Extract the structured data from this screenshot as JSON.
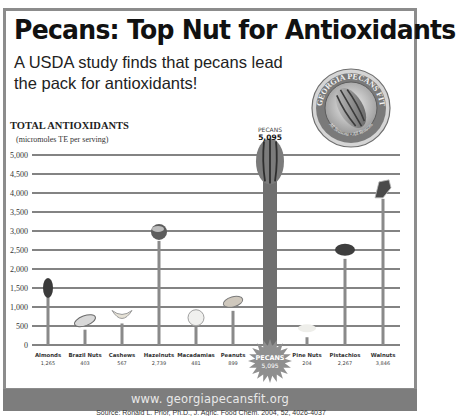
{
  "header": {
    "title": "Pecans: Top Nut for Antioxidants",
    "subtitle": "A USDA study finds that pecans lead the pack for antioxidants!"
  },
  "badge": {
    "top_text": "GEORGIA PECANS FIT",
    "bottom_text": "All Seasons • All Reasons",
    "icon": "pecan-nut-icon"
  },
  "footer": {
    "url": "www. georgiapecansfit.org",
    "source": "Source: Ronald L. Prior, Ph.D., J. Agric. Food Chem. 2004, 52, 4026-4037"
  },
  "colors": {
    "frame": "#8c8c8c",
    "bar": "#8a8a8a",
    "pecan_bar": "#6f6f6f",
    "grid": "#5a5a5a",
    "url_band": "#7d7d7d",
    "starburst": "#8f8f8f"
  },
  "chart_data": {
    "type": "bar",
    "title": "TOTAL ANTIOXIDANTS",
    "ylabel": "TOTAL ANTIOXIDANTS",
    "ylabel_sub": "(micromoles TE per serving)",
    "xlabel": "",
    "ylim": [
      0,
      5000
    ],
    "yticks": [
      0,
      500,
      1000,
      1500,
      2000,
      2500,
      3000,
      3500,
      4000,
      4500,
      5000
    ],
    "ytick_labels": [
      "0",
      "500",
      "1,000",
      "1,500",
      "2,000",
      "2,500",
      "3,000",
      "3,500",
      "4,000",
      "4,500",
      "5,000"
    ],
    "grid": true,
    "categories": [
      "Almonds",
      "Brazil Nuts",
      "Cashews",
      "Hazelnuts",
      "Macadamias",
      "Peanuts",
      "Pecans",
      "Pine Nuts",
      "Pistachios",
      "Walnuts"
    ],
    "values": [
      1265,
      403,
      567,
      2739,
      481,
      899,
      5095,
      204,
      2267,
      3846
    ],
    "value_labels": [
      "1,265",
      "403",
      "567",
      "2,739",
      "481",
      "899",
      "5,095",
      "204",
      "2,267",
      "3,846"
    ],
    "highlight": {
      "category": "Pecans",
      "label_top": "PECANS",
      "value_label": "5,095"
    },
    "nut_icons": [
      "almond-icon",
      "brazil-nut-icon",
      "cashew-icon",
      "hazelnut-icon",
      "macadamia-icon",
      "peanut-icon",
      "pecan-icon",
      "pine-nut-icon",
      "pistachio-icon",
      "walnut-icon"
    ]
  }
}
